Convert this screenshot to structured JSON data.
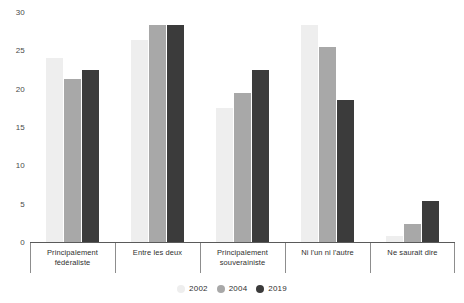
{
  "chart_data": {
    "type": "bar",
    "title": "",
    "xlabel": "",
    "ylabel": "",
    "ylim": [
      0,
      30
    ],
    "y_ticks": [
      0,
      5,
      10,
      15,
      20,
      25,
      30
    ],
    "y_tick_labels": [
      "0",
      "5",
      "10",
      "15",
      "20",
      "25",
      "30"
    ],
    "grid": false,
    "legend_position": "bottom",
    "categories": [
      "Principalement fédéraliste",
      "Entre les deux",
      "Principalement souverainiste",
      "Ni l'un ni l'autre",
      "Ne saurait dire"
    ],
    "series": [
      {
        "name": "2002",
        "color": "#eeeeee",
        "values": [
          24.0,
          26.3,
          17.5,
          28.3,
          0.8
        ]
      },
      {
        "name": "2004",
        "color": "#a8a8a8",
        "values": [
          21.3,
          28.3,
          19.5,
          25.4,
          2.4
        ]
      },
      {
        "name": "2019",
        "color": "#3b3b3b",
        "values": [
          22.4,
          28.3,
          22.4,
          18.5,
          5.3
        ]
      }
    ]
  },
  "legend": {
    "items": [
      {
        "label": "2002",
        "color": "#eeeeee"
      },
      {
        "label": "2004",
        "color": "#a8a8a8"
      },
      {
        "label": "2019",
        "color": "#3b3b3b"
      }
    ]
  }
}
